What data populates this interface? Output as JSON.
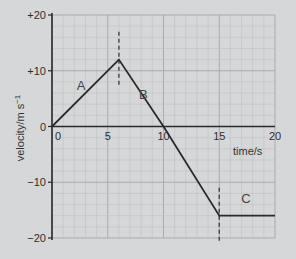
{
  "chart_data": {
    "type": "line",
    "title": "",
    "xlabel": "time/s",
    "ylabel": "velocity/m s⁻¹",
    "xlim": [
      0,
      20
    ],
    "ylim": [
      -20,
      20
    ],
    "grid": true,
    "x_ticks": [
      0,
      5,
      10,
      15,
      20
    ],
    "x_tick_labels": [
      "0",
      "5",
      "10",
      "15",
      "20"
    ],
    "y_ticks": [
      20,
      10,
      0,
      -10,
      -20
    ],
    "y_tick_labels": [
      "+20",
      "+10",
      "0",
      "−10",
      "−20"
    ],
    "series": [
      {
        "name": "velocity",
        "x": [
          0,
          6,
          10,
          15,
          20
        ],
        "y": [
          0,
          12,
          0,
          -16,
          -16
        ]
      }
    ],
    "segments": [
      {
        "label": "A",
        "from": [
          0,
          0
        ],
        "to": [
          6,
          12
        ]
      },
      {
        "label": "B",
        "from": [
          6,
          12
        ],
        "to": [
          15,
          -16
        ]
      },
      {
        "label": "C",
        "from": [
          15,
          -16
        ],
        "to": [
          20,
          -16
        ]
      }
    ],
    "dashed_markers": [
      {
        "x": 6,
        "y_from": 7,
        "y_to": 17
      },
      {
        "x": 15,
        "y_from": -11,
        "y_to": -21
      }
    ],
    "colors": {
      "background": "#d6d7d8",
      "grid_major": "#a9abad",
      "grid_minor": "#bfc1c3",
      "line": "#2a2a2a"
    }
  }
}
